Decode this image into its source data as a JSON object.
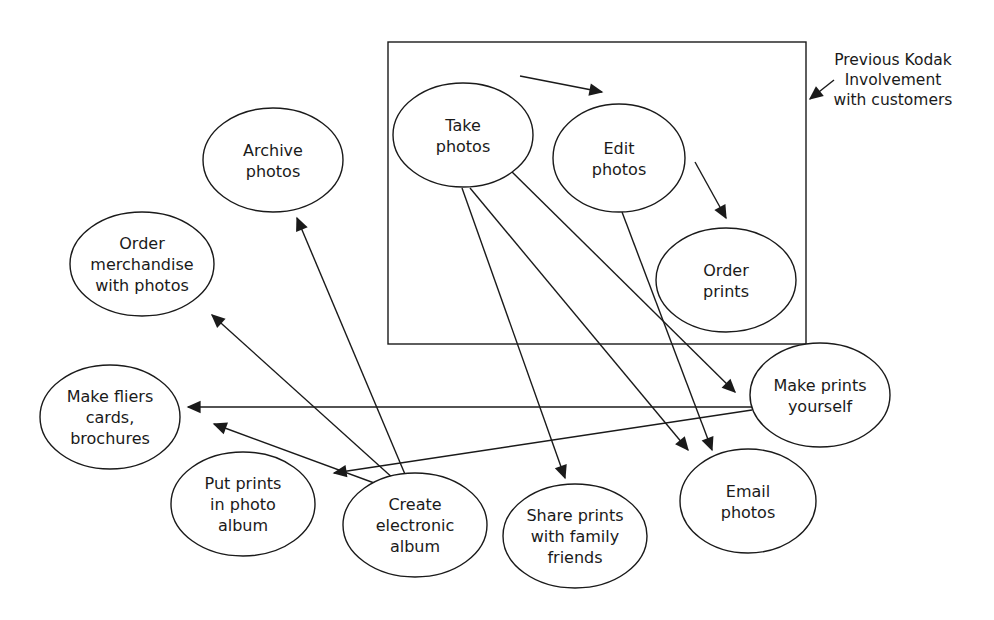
{
  "boundary": {
    "label_lines": [
      "Previous Kodak",
      "Involvement",
      "with customers"
    ],
    "box": {
      "x": 388,
      "y": 42,
      "w": 418,
      "h": 302
    }
  },
  "nodes": [
    {
      "id": "take",
      "lines": [
        "Take",
        "photos"
      ],
      "cx": 463,
      "cy": 135,
      "rx": 70,
      "ry": 52,
      "inside_box": true
    },
    {
      "id": "edit",
      "lines": [
        "Edit",
        "photos"
      ],
      "cx": 619,
      "cy": 158,
      "rx": 66,
      "ry": 54,
      "inside_box": true
    },
    {
      "id": "order_prints",
      "lines": [
        "Order",
        "prints"
      ],
      "cx": 726,
      "cy": 280,
      "rx": 70,
      "ry": 52,
      "inside_box": true
    },
    {
      "id": "archive",
      "lines": [
        "Archive",
        "photos"
      ],
      "cx": 273,
      "cy": 160,
      "rx": 70,
      "ry": 52
    },
    {
      "id": "merch",
      "lines": [
        "Order",
        "merchandise",
        "with photos"
      ],
      "cx": 142,
      "cy": 264,
      "rx": 72,
      "ry": 52
    },
    {
      "id": "fliers",
      "lines": [
        "Make fliers",
        "cards,",
        "brochures"
      ],
      "cx": 110,
      "cy": 417,
      "rx": 70,
      "ry": 52
    },
    {
      "id": "put_prints",
      "lines": [
        "Put prints",
        "in photo",
        "album"
      ],
      "cx": 243,
      "cy": 504,
      "rx": 72,
      "ry": 52
    },
    {
      "id": "electronic",
      "lines": [
        "Create",
        "electronic",
        "album"
      ],
      "cx": 415,
      "cy": 525,
      "rx": 72,
      "ry": 52
    },
    {
      "id": "share",
      "lines": [
        "Share prints",
        "with family",
        "friends"
      ],
      "cx": 575,
      "cy": 536,
      "rx": 72,
      "ry": 52
    },
    {
      "id": "email",
      "lines": [
        "Email",
        "photos"
      ],
      "cx": 748,
      "cy": 501,
      "rx": 68,
      "ry": 52
    },
    {
      "id": "make_prints",
      "lines": [
        "Make prints",
        "yourself"
      ],
      "cx": 820,
      "cy": 395,
      "rx": 70,
      "ry": 52
    }
  ],
  "edges": [
    {
      "from": "take",
      "to": "edit",
      "x1": 520,
      "y1": 76,
      "x2": 602,
      "y2": 92
    },
    {
      "from": "edit",
      "to": "order_prints",
      "x1": 695,
      "y1": 162,
      "x2": 726,
      "y2": 218
    },
    {
      "from": "take",
      "to": "make_prints",
      "x1": 500,
      "y1": 160,
      "x2": 735,
      "y2": 392
    },
    {
      "from": "take",
      "to": "email",
      "x1": 470,
      "y1": 188,
      "x2": 688,
      "y2": 450
    },
    {
      "from": "take",
      "to": "share",
      "x1": 462,
      "y1": 188,
      "x2": 565,
      "y2": 478
    },
    {
      "from": "edit",
      "to": "email",
      "x1": 622,
      "y1": 212,
      "x2": 712,
      "y2": 450
    },
    {
      "from": "make_prints",
      "to": "fliers",
      "x1": 752,
      "y1": 407,
      "x2": 188,
      "y2": 407
    },
    {
      "from": "make_prints",
      "to": "put_prints",
      "x1": 752,
      "y1": 410,
      "x2": 334,
      "y2": 473
    },
    {
      "from": "electronic",
      "to": "archive",
      "x1": 415,
      "y1": 498,
      "x2": 297,
      "y2": 218
    },
    {
      "from": "electronic",
      "to": "merch",
      "x1": 415,
      "y1": 498,
      "x2": 212,
      "y2": 315
    },
    {
      "from": "electronic",
      "to": "fliers",
      "x1": 415,
      "y1": 498,
      "x2": 214,
      "y2": 424
    }
  ],
  "note_arrow": {
    "x1": 834,
    "y1": 80,
    "x2": 810,
    "y2": 99
  }
}
